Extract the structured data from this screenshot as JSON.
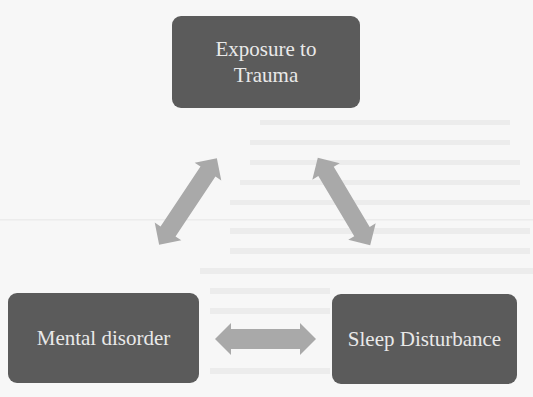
{
  "diagram": {
    "type": "relationship-triangle",
    "nodes": [
      {
        "id": "top",
        "label": "Exposure to Trauma",
        "lines": [
          "Exposure to",
          "Trauma"
        ]
      },
      {
        "id": "left",
        "label": "Mental disorder"
      },
      {
        "id": "right",
        "label": "Sleep Disturbance"
      }
    ],
    "edges": [
      {
        "from": "top",
        "to": "left",
        "direction": "bidirectional"
      },
      {
        "from": "top",
        "to": "right",
        "direction": "bidirectional"
      },
      {
        "from": "left",
        "to": "right",
        "direction": "bidirectional"
      }
    ]
  },
  "colors": {
    "node_fill": "#5b5b5b",
    "node_text": "#e9e9e9",
    "arrow_fill": "#a9a9a9",
    "background": "#f7f7f7"
  }
}
